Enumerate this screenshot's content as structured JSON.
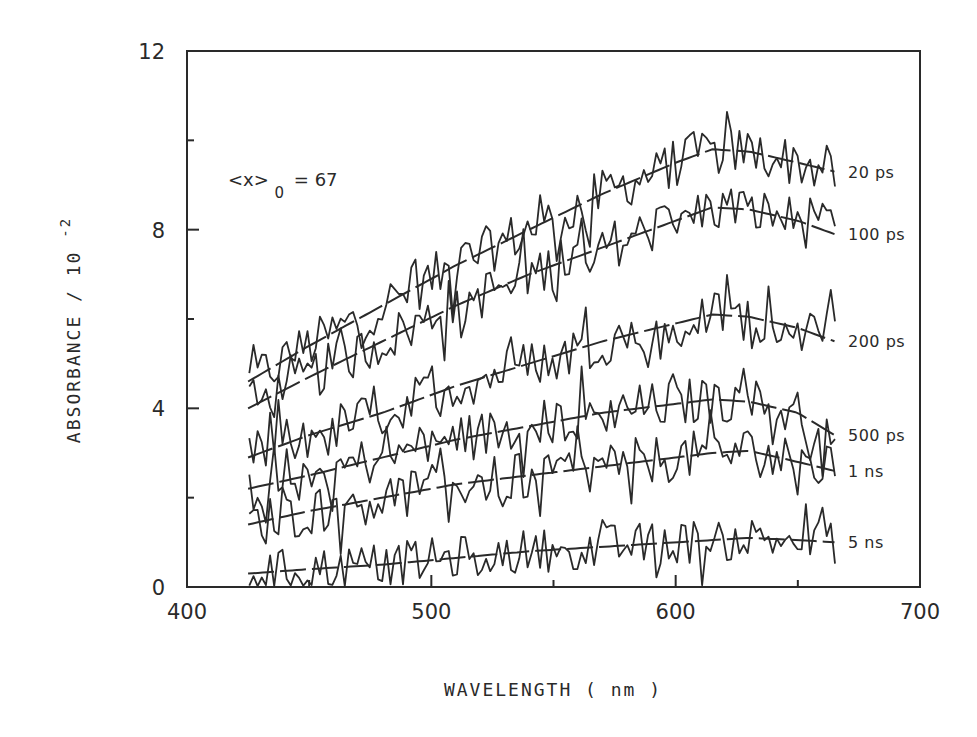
{
  "chart_data": {
    "type": "line",
    "title": "",
    "xlabel": "WAVELENGTH ( nm )",
    "ylabel": "ABSORBANCE / 10",
    "ylabel_exponent": "-2",
    "xlim": [
      400,
      700
    ],
    "ylim": [
      0,
      12
    ],
    "x_ticks": [
      400,
      500,
      600,
      700
    ],
    "x_minor_ticks": [
      450,
      550,
      650
    ],
    "y_ticks": [
      0,
      4,
      8,
      12
    ],
    "y_minor_ticks": [
      2,
      6,
      10
    ],
    "grid": false,
    "legend_position": "right (inline labels at curve ends)",
    "annotation": {
      "text_main": "<x>",
      "subscript": "0",
      "text_after": "= 67"
    },
    "x": [
      425,
      450,
      480,
      510,
      540,
      570,
      600,
      615,
      630,
      650,
      665
    ],
    "series": [
      {
        "name": "20 ps",
        "label": "20 ps",
        "values": [
          4.6,
          5.4,
          6.3,
          7.2,
          8.0,
          8.8,
          9.5,
          9.8,
          9.75,
          9.5,
          9.3
        ]
      },
      {
        "name": "100 ps",
        "label": "100 ps",
        "values": [
          4.0,
          4.7,
          5.5,
          6.3,
          7.0,
          7.6,
          8.2,
          8.5,
          8.45,
          8.2,
          7.9
        ]
      },
      {
        "name": "200 ps",
        "label": "200 ps",
        "values": [
          2.9,
          3.4,
          3.9,
          4.5,
          5.0,
          5.5,
          5.9,
          6.1,
          6.05,
          5.8,
          5.5
        ]
      },
      {
        "name": "500 ps",
        "label": "500 ps",
        "values": [
          2.2,
          2.5,
          2.9,
          3.3,
          3.6,
          3.9,
          4.1,
          4.2,
          4.15,
          3.9,
          3.4
        ]
      },
      {
        "name": "1 ns",
        "label": "1  ns",
        "values": [
          1.4,
          1.7,
          2.0,
          2.3,
          2.5,
          2.7,
          2.9,
          3.0,
          3.05,
          2.8,
          2.6
        ]
      },
      {
        "name": "5 ns",
        "label": "5  ns",
        "values": [
          0.3,
          0.4,
          0.5,
          0.65,
          0.8,
          0.9,
          1.0,
          1.05,
          1.1,
          1.05,
          1.0
        ]
      }
    ],
    "noise_amplitude": 0.55
  },
  "axes": {
    "x_tick_labels": [
      "400",
      "500",
      "600",
      "700"
    ],
    "y_tick_labels": [
      "0",
      "4",
      "8",
      "12"
    ]
  },
  "colors": {
    "ink": "#2a2a2a",
    "background": "#ffffff"
  }
}
